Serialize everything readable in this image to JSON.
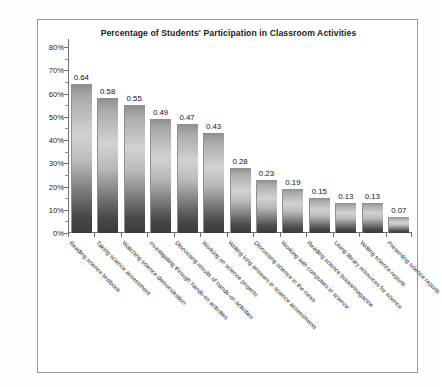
{
  "chart_data": {
    "type": "bar",
    "title": "Percentage of Students' Participation in Classroom Activities",
    "xlabel": "",
    "ylabel": "",
    "ylim": [
      0,
      0.8
    ],
    "grid": false,
    "legend": false,
    "ytick_labels": [
      "80%",
      "70%",
      "60%",
      "50%",
      "40%",
      "30%",
      "20%",
      "10%",
      "0%"
    ],
    "ytick_values": [
      0.8,
      0.7,
      0.6,
      0.5,
      0.4,
      0.3,
      0.2,
      0.1,
      0.0
    ],
    "categories": [
      "Reading science textbook",
      "Taking science assessment",
      "Watching science demonstration",
      "Investigating through hands-on activities",
      "Discussing results of hands-on activities",
      "Working on science projects",
      "Writing long answers in science assessments",
      "Discussing science in the news",
      "Working with computers in science",
      "Reading science books/magazine",
      "Using library resources for science",
      "Writing science reports",
      "Presenting science reports"
    ],
    "values": [
      0.64,
      0.58,
      0.55,
      0.49,
      0.47,
      0.43,
      0.28,
      0.23,
      0.19,
      0.15,
      0.13,
      0.13,
      0.07
    ],
    "data_labels": [
      "0.64",
      "0.58",
      "0.55",
      "0.49",
      "0.47",
      "0.43",
      "0.28",
      "0.23",
      "0.19",
      "0.15",
      "0.13",
      "0.13",
      "0.07"
    ]
  },
  "colors": {
    "bar_top": "#8d8d8d",
    "bar_mid": "#d2d2d2",
    "bar_bottom": "#3a3a3a",
    "axis": "#6f6f6f",
    "border": "#9a9a9a",
    "text": "#1a1a1a",
    "background": "#ffffff"
  }
}
